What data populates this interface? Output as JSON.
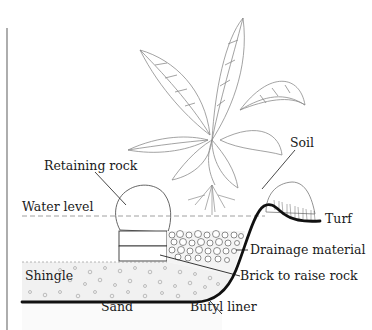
{
  "diagram": {
    "colors": {
      "line": "#1a1a1a",
      "liner": "#111111",
      "faint": "#9a9a9a",
      "background": "#ffffff"
    },
    "labels": {
      "retaining_rock": "Retaining rock",
      "soil": "Soil",
      "water_level": "Water level",
      "turf": "Turf",
      "drainage_material": "Drainage material",
      "shingle": "Shingle",
      "brick_to_raise_rock": "Brick to raise rock",
      "sand": "Sand",
      "butyl_liner": "Butyl liner"
    }
  }
}
